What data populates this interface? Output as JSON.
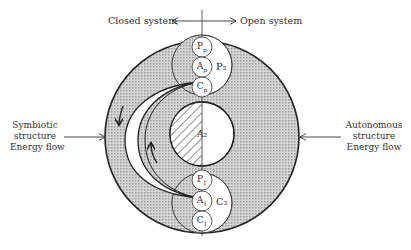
{
  "axis": {
    "left_label": "Closed system",
    "right_label": "Open system"
  },
  "left_input": {
    "lines": [
      "Symbiotic",
      "structure",
      "Energy flow"
    ]
  },
  "right_input": {
    "lines": [
      "Autonomous",
      "structure",
      "Energy flow"
    ]
  },
  "nodes": {
    "top_big": "P₂",
    "bottom_big": "C₂",
    "middle": "A₂",
    "top_small": [
      {
        "base": "P",
        "sub": "p"
      },
      {
        "base": "A",
        "sub": "p"
      },
      {
        "base": "C",
        "sub": "p"
      }
    ],
    "bottom_small": [
      {
        "base": "P",
        "sub": "1"
      },
      {
        "base": "A",
        "sub": "1"
      },
      {
        "base": "C",
        "sub": "1"
      }
    ]
  },
  "colors": {
    "ink": "#222222",
    "shade": "#bdbdbd",
    "background": "#ffffff"
  }
}
